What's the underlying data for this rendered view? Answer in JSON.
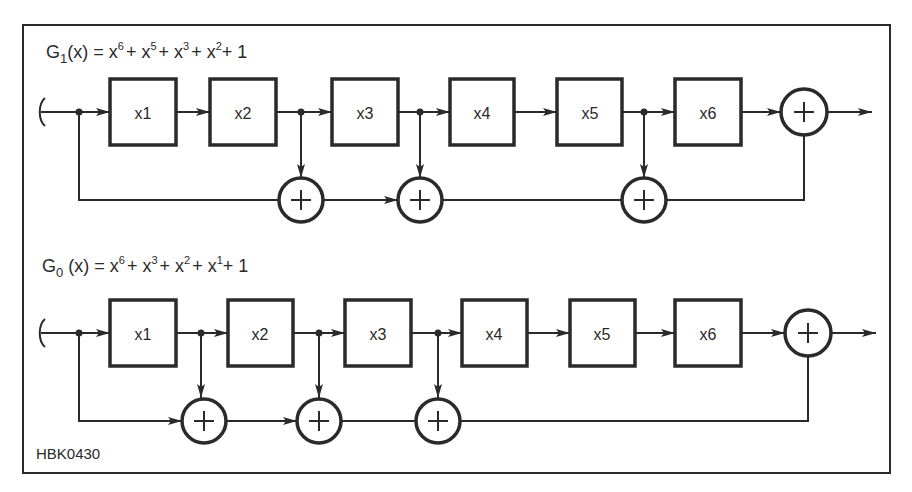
{
  "figure_id": "HBK0430",
  "colors": {
    "ink": "#2a2a2a",
    "background": "#ffffff"
  },
  "diagrams": [
    {
      "name": "G1",
      "title": {
        "base": "G",
        "sub": "1",
        "rest": "(x) = ",
        "terms": [
          {
            "b": "x",
            "e": "6",
            "sep": "+ "
          },
          {
            "b": "x",
            "e": "5",
            "sep": "+ "
          },
          {
            "b": "x",
            "e": "3",
            "sep": "+ "
          },
          {
            "b": "x",
            "e": "2",
            "sep": "+ "
          },
          {
            "b": "1",
            "e": "",
            "sep": ""
          }
        ]
      },
      "registers": [
        "x1",
        "x2",
        "x3",
        "x4",
        "x5",
        "x6"
      ],
      "adder_symbol": "+"
    },
    {
      "name": "G0",
      "title": {
        "base": "G",
        "sub": "0",
        "rest": " (x) = ",
        "terms": [
          {
            "b": "x",
            "e": "6",
            "sep": "+ "
          },
          {
            "b": "x",
            "e": "3",
            "sep": "+ "
          },
          {
            "b": "x",
            "e": "2",
            "sep": "+ "
          },
          {
            "b": "x",
            "e": "1",
            "sep": "+ "
          },
          {
            "b": "1",
            "e": "",
            "sep": ""
          }
        ]
      },
      "registers": [
        "x1",
        "x2",
        "x3",
        "x4",
        "x5",
        "x6"
      ],
      "adder_symbol": "+"
    }
  ]
}
